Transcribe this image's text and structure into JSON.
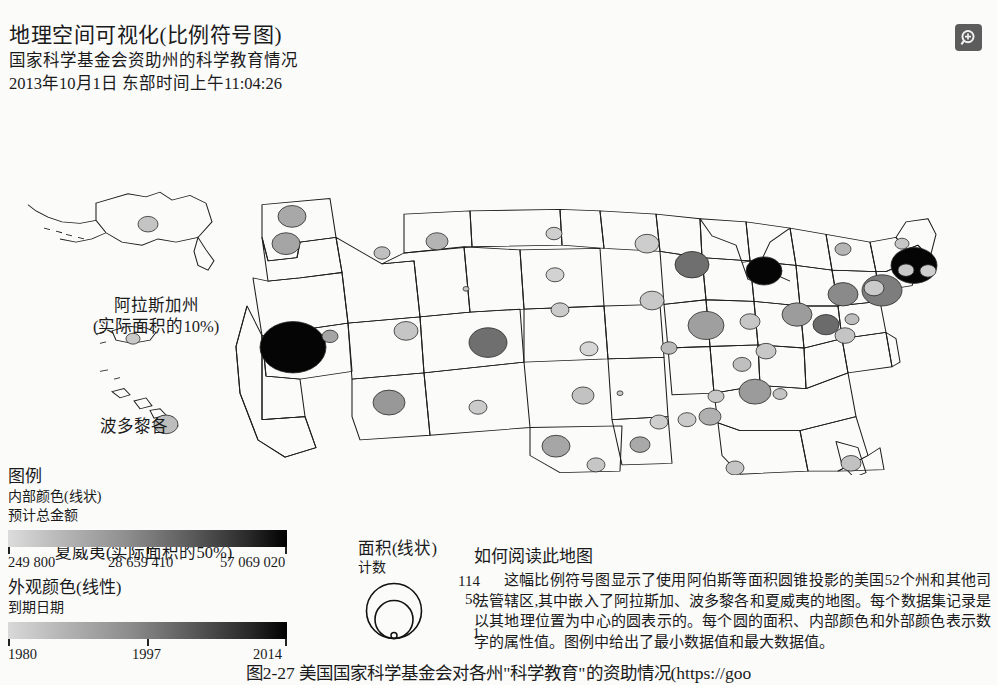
{
  "header": {
    "title": "地理空间可视化(比例符号图)",
    "subtitle": "国家科学基金会资助州的科学教育情况",
    "timestamp": "2013年10月1日 东部时间上午11:04:26",
    "zoom_icon": "zoom-in-icon"
  },
  "map": {
    "labels": {
      "alaska": "阿拉斯加州",
      "alaska_scale": "(实际面积的10%)",
      "puerto_rico": "波多黎各",
      "hawaii": "夏威夷(实际面积的50%)"
    }
  },
  "legend": {
    "title": "图例",
    "fill": {
      "channel": "内部颜色(线状)",
      "field": "预计总金额",
      "ticks": [
        "249 800",
        "28 659 410",
        "57 069 020"
      ],
      "color_min": "#dcdcdc",
      "color_max": "#000000"
    },
    "stroke": {
      "channel": "外观颜色(线性)",
      "field": "到期日期",
      "ticks": [
        "1980",
        "1997",
        "2014"
      ],
      "color_min": "#d9d9d9",
      "color_max": "#000000"
    },
    "size": {
      "channel": "面积(线状)",
      "field": "计数",
      "ticks": [
        "114",
        "58",
        "1"
      ]
    }
  },
  "howto": {
    "title": "如何阅读此地图",
    "body": "这幅比例符号图显示了使用阿伯斯等面积圆锥投影的美国52个州和其他司法管辖区,其中嵌入了阿拉斯加、波多黎各和夏威夷的地图。每个数据集记录是以其地理位置为中心的圆表示的。每个圆的面积、内部颜色和外部颜色表示数字的属性值。图例中给出了最小数据值和最大数据值。"
  },
  "caption": "图2-27 美国国家科学基金会对各州\"科学教育\"的资助情况(https://goo",
  "chart_data": {
    "type": "scatter",
    "title": "国家科学基金会资助州的科学教育情况",
    "projection": "Albers Equal Area Conic",
    "encodings": {
      "size": {
        "field": "计数",
        "min": 1,
        "max": 114
      },
      "fill": {
        "field": "预计总金额",
        "min": 249800,
        "max": 57069020
      },
      "stroke": {
        "field": "到期日期",
        "min": 1980,
        "max": 2014
      }
    },
    "points": [
      {
        "x": 292,
        "y": 143,
        "r": 14,
        "fill": "#a8a8a8"
      },
      {
        "x": 286,
        "y": 178,
        "r": 14,
        "fill": "#a5a5a5"
      },
      {
        "x": 382,
        "y": 190,
        "r": 8,
        "fill": "#c0c0c0"
      },
      {
        "x": 437,
        "y": 175,
        "r": 11,
        "fill": "#b4b4b4"
      },
      {
        "x": 554,
        "y": 165,
        "r": 8,
        "fill": "#cfcfcf"
      },
      {
        "x": 555,
        "y": 218,
        "r": 9,
        "fill": "#d2d2d2"
      },
      {
        "x": 560,
        "y": 263,
        "r": 9,
        "fill": "#cbcbcb"
      },
      {
        "x": 466,
        "y": 236,
        "r": 3,
        "fill": "#c7c7c7"
      },
      {
        "x": 293,
        "y": 311,
        "r": 33,
        "fill": "#050505"
      },
      {
        "x": 330,
        "y": 297,
        "r": 8,
        "fill": "#a4a4a4"
      },
      {
        "x": 406,
        "y": 290,
        "r": 12,
        "fill": "#c5c5c5"
      },
      {
        "x": 488,
        "y": 305,
        "r": 19,
        "fill": "#6f6f6f"
      },
      {
        "x": 589,
        "y": 313,
        "r": 9,
        "fill": "#d6d6d6"
      },
      {
        "x": 389,
        "y": 382,
        "r": 16,
        "fill": "#989898"
      },
      {
        "x": 478,
        "y": 388,
        "r": 9,
        "fill": "#cbcbcb"
      },
      {
        "x": 583,
        "y": 373,
        "r": 11,
        "fill": "#c2c2c2"
      },
      {
        "x": 556,
        "y": 438,
        "r": 14,
        "fill": "#a6a6a6"
      },
      {
        "x": 596,
        "y": 462,
        "r": 9,
        "fill": "#c6c6c6"
      },
      {
        "x": 647,
        "y": 178,
        "r": 12,
        "fill": "#cdcdcd"
      },
      {
        "x": 692,
        "y": 205,
        "r": 17,
        "fill": "#6f6f6f"
      },
      {
        "x": 764,
        "y": 213,
        "r": 18,
        "fill": "#050505"
      },
      {
        "x": 652,
        "y": 251,
        "r": 12,
        "fill": "#c8c8c8"
      },
      {
        "x": 706,
        "y": 283,
        "r": 18,
        "fill": "#9f9f9f"
      },
      {
        "x": 750,
        "y": 278,
        "r": 10,
        "fill": "#c6c6c6"
      },
      {
        "x": 797,
        "y": 269,
        "r": 15,
        "fill": "#9c9c9c"
      },
      {
        "x": 669,
        "y": 312,
        "r": 8,
        "fill": "#b9b9b9"
      },
      {
        "x": 766,
        "y": 316,
        "r": 10,
        "fill": "#c7c7c7"
      },
      {
        "x": 843,
        "y": 243,
        "r": 15,
        "fill": "#8a8a8a"
      },
      {
        "x": 882,
        "y": 238,
        "r": 20,
        "fill": "#7d7d7d"
      },
      {
        "x": 845,
        "y": 296,
        "r": 10,
        "fill": "#c4c4c4"
      },
      {
        "x": 826,
        "y": 282,
        "r": 13,
        "fill": "#6b6b6b"
      },
      {
        "x": 852,
        "y": 275,
        "r": 7,
        "fill": "#bdbdbd"
      },
      {
        "x": 843,
        "y": 185,
        "r": 8,
        "fill": "#b5b5b5"
      },
      {
        "x": 914,
        "y": 206,
        "r": 23,
        "fill": "#050505"
      },
      {
        "x": 906,
        "y": 212,
        "r": 8,
        "fill": "#c9c9c9"
      },
      {
        "x": 928,
        "y": 213,
        "r": 8,
        "fill": "#cecece"
      },
      {
        "x": 874,
        "y": 235,
        "r": 10,
        "fill": "#cacaca"
      },
      {
        "x": 902,
        "y": 178,
        "r": 7,
        "fill": "#c6c6c6"
      },
      {
        "x": 742,
        "y": 333,
        "r": 9,
        "fill": "#bfbfbf"
      },
      {
        "x": 755,
        "y": 368,
        "r": 16,
        "fill": "#9b9b9b"
      },
      {
        "x": 780,
        "y": 371,
        "r": 7,
        "fill": "#c3c3c3"
      },
      {
        "x": 716,
        "y": 374,
        "r": 8,
        "fill": "#c8c8c8"
      },
      {
        "x": 620,
        "y": 370,
        "r": 3,
        "fill": "#c9c9c9"
      },
      {
        "x": 710,
        "y": 400,
        "r": 11,
        "fill": "#b0b0b0"
      },
      {
        "x": 659,
        "y": 407,
        "r": 9,
        "fill": "#cecece"
      },
      {
        "x": 687,
        "y": 404,
        "r": 9,
        "fill": "#cacaca"
      },
      {
        "x": 640,
        "y": 436,
        "r": 10,
        "fill": "#a9a9a9"
      },
      {
        "x": 851,
        "y": 460,
        "r": 10,
        "fill": "#c2c2c2"
      },
      {
        "x": 735,
        "y": 466,
        "r": 9,
        "fill": "#c5c5c5"
      },
      {
        "x": 166,
        "y": 410,
        "r": 12,
        "fill": "#bdbdbd"
      },
      {
        "x": 148,
        "y": 153,
        "r": 10,
        "fill": "#c4c4c4"
      },
      {
        "x": 133,
        "y": 300,
        "r": 7,
        "fill": "#c9c9c9"
      }
    ]
  }
}
